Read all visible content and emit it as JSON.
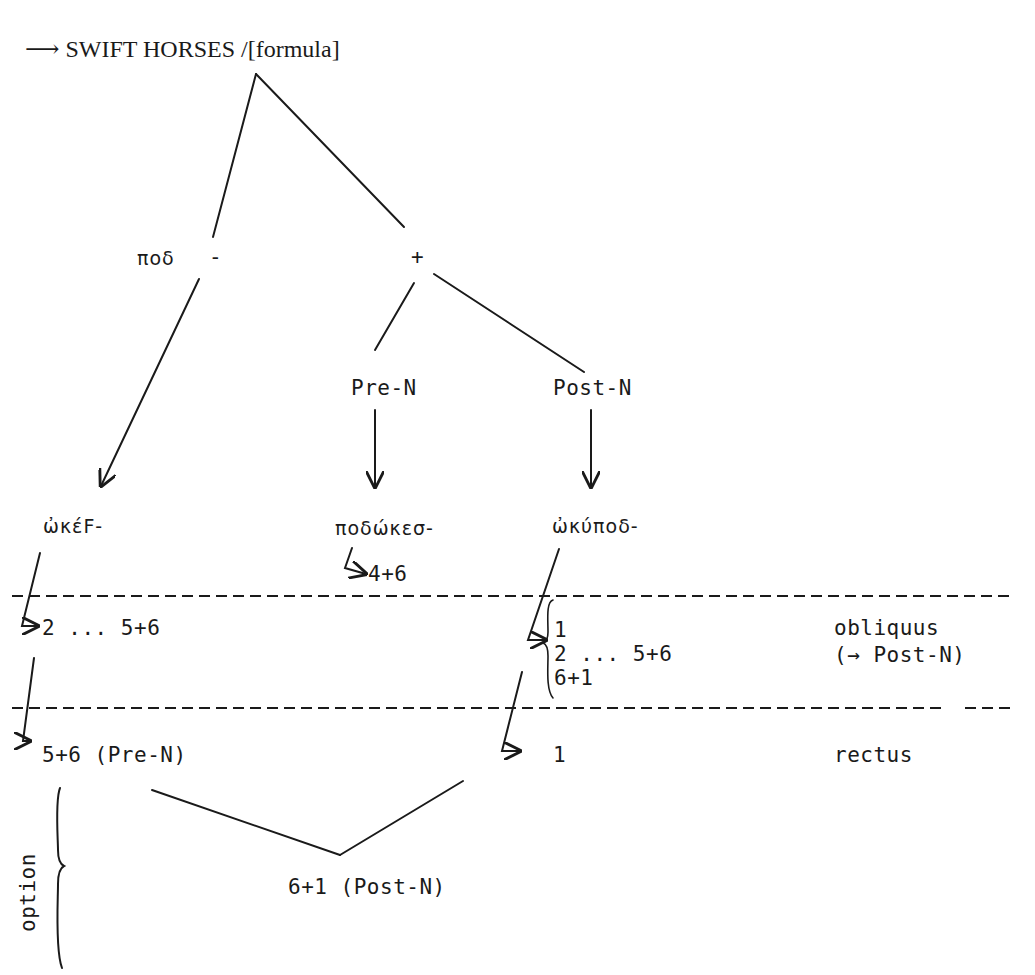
{
  "title": {
    "arrow": "⟶",
    "text": "SWIFT HORSES /[formula]"
  },
  "tree": {
    "pod_label": "ποδ",
    "minus": "-",
    "plus": "+",
    "pre_n": "Pre-N",
    "post_n": "Post-N"
  },
  "forms": {
    "okef": "ὠκέϜ-",
    "podokes": "ποδώκεσ-",
    "okupod": "ὠκύποδ-"
  },
  "sub": {
    "podokes_result": "4+6"
  },
  "obliquus_row": {
    "left": "2 ... 5+6",
    "right_items": [
      "1",
      "2 ... 5+6",
      "6+1"
    ],
    "label_1": "obliquus",
    "label_2": "(→ Post-N)"
  },
  "rectus_row": {
    "left": "5+6 (Pre-N)",
    "right": "1",
    "label": "rectus"
  },
  "option": {
    "label": "option",
    "result": "6+1 (Post-N)"
  },
  "colors": {
    "ink": "#1a1a1a",
    "background": "#ffffff"
  }
}
